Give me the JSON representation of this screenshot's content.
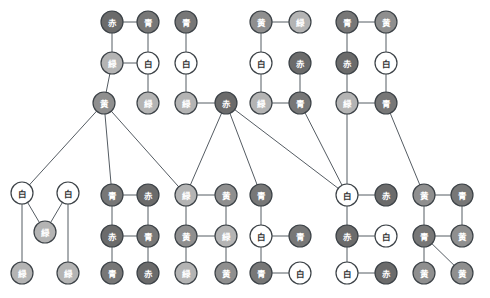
{
  "canvas": {
    "width": 490,
    "height": 298,
    "background": "#ffffff"
  },
  "style": {
    "node_radius": 11,
    "node_stroke": "#3c4247",
    "edge_stroke": "#555c63",
    "edge_width": 1,
    "label_light": "#ffffff",
    "label_dark": "#333333"
  },
  "palette": {
    "赤": "#6b6b6b",
    "青": "#777777",
    "緑": "#b4b4b4",
    "黄": "#8f8f8f",
    "白": "#ffffff"
  },
  "legend": {
    "colors": [
      {
        "name": "赤",
        "label": "赤",
        "hex": "#6b6b6b"
      },
      {
        "name": "青",
        "label": "青",
        "hex": "#777777"
      },
      {
        "name": "緑",
        "label": "緑",
        "hex": "#b4b4b4"
      },
      {
        "name": "黄",
        "label": "黄",
        "hex": "#8f8f8f"
      },
      {
        "name": "白",
        "label": "白",
        "hex": "#ffffff"
      }
    ]
  },
  "graph": {
    "type": "node-link-diagram",
    "node_count": 63,
    "edge_count": 70,
    "nodes": [
      {
        "id": "n1",
        "label": "赤",
        "color": "赤",
        "x": 112,
        "y": 22
      },
      {
        "id": "n2",
        "label": "青",
        "color": "青",
        "x": 148,
        "y": 22
      },
      {
        "id": "n3",
        "label": "青",
        "color": "青",
        "x": 186,
        "y": 22
      },
      {
        "id": "n4",
        "label": "黄",
        "color": "黄",
        "x": 261,
        "y": 22
      },
      {
        "id": "n5",
        "label": "緑",
        "color": "緑",
        "x": 300,
        "y": 22
      },
      {
        "id": "n6",
        "label": "青",
        "color": "青",
        "x": 347,
        "y": 22
      },
      {
        "id": "n7",
        "label": "黄",
        "color": "黄",
        "x": 386,
        "y": 22
      },
      {
        "id": "n8",
        "label": "緑",
        "color": "緑",
        "x": 112,
        "y": 63
      },
      {
        "id": "n9",
        "label": "白",
        "color": "白",
        "x": 148,
        "y": 63
      },
      {
        "id": "n10",
        "label": "白",
        "color": "白",
        "x": 186,
        "y": 63
      },
      {
        "id": "n11",
        "label": "白",
        "color": "白",
        "x": 261,
        "y": 63
      },
      {
        "id": "n12",
        "label": "赤",
        "color": "赤",
        "x": 300,
        "y": 63
      },
      {
        "id": "n13",
        "label": "赤",
        "color": "赤",
        "x": 347,
        "y": 63
      },
      {
        "id": "n14",
        "label": "白",
        "color": "白",
        "x": 386,
        "y": 63
      },
      {
        "id": "n15",
        "label": "黄",
        "color": "黄",
        "x": 104,
        "y": 103
      },
      {
        "id": "n16",
        "label": "緑",
        "color": "緑",
        "x": 148,
        "y": 103
      },
      {
        "id": "n17",
        "label": "緑",
        "color": "緑",
        "x": 186,
        "y": 103
      },
      {
        "id": "n18",
        "label": "赤",
        "color": "赤",
        "x": 226,
        "y": 103
      },
      {
        "id": "n19",
        "label": "緑",
        "color": "緑",
        "x": 261,
        "y": 103
      },
      {
        "id": "n20",
        "label": "青",
        "color": "青",
        "x": 300,
        "y": 103
      },
      {
        "id": "n21",
        "label": "緑",
        "color": "緑",
        "x": 347,
        "y": 103
      },
      {
        "id": "n22",
        "label": "青",
        "color": "青",
        "x": 386,
        "y": 103
      },
      {
        "id": "n23",
        "label": "白",
        "color": "白",
        "x": 22,
        "y": 193
      },
      {
        "id": "n24",
        "label": "白",
        "color": "白",
        "x": 68,
        "y": 193
      },
      {
        "id": "n25",
        "label": "青",
        "color": "青",
        "x": 112,
        "y": 195
      },
      {
        "id": "n26",
        "label": "赤",
        "color": "赤",
        "x": 148,
        "y": 195
      },
      {
        "id": "n27",
        "label": "緑",
        "color": "緑",
        "x": 186,
        "y": 195
      },
      {
        "id": "n28",
        "label": "黄",
        "color": "黄",
        "x": 226,
        "y": 195
      },
      {
        "id": "n29",
        "label": "青",
        "color": "青",
        "x": 261,
        "y": 195
      },
      {
        "id": "n30",
        "label": "白",
        "color": "白",
        "x": 347,
        "y": 195
      },
      {
        "id": "n31",
        "label": "赤",
        "color": "赤",
        "x": 386,
        "y": 195
      },
      {
        "id": "n32",
        "label": "黄",
        "color": "黄",
        "x": 424,
        "y": 195
      },
      {
        "id": "n33",
        "label": "青",
        "color": "青",
        "x": 462,
        "y": 195
      },
      {
        "id": "n34",
        "label": "緑",
        "color": "緑",
        "x": 45,
        "y": 232
      },
      {
        "id": "n35",
        "label": "赤",
        "color": "赤",
        "x": 112,
        "y": 236
      },
      {
        "id": "n36",
        "label": "青",
        "color": "青",
        "x": 148,
        "y": 236
      },
      {
        "id": "n37",
        "label": "黄",
        "color": "黄",
        "x": 186,
        "y": 236
      },
      {
        "id": "n38",
        "label": "緑",
        "color": "緑",
        "x": 226,
        "y": 236
      },
      {
        "id": "n39",
        "label": "白",
        "color": "白",
        "x": 261,
        "y": 236
      },
      {
        "id": "n40",
        "label": "青",
        "color": "青",
        "x": 300,
        "y": 236
      },
      {
        "id": "n41",
        "label": "赤",
        "color": "赤",
        "x": 347,
        "y": 236
      },
      {
        "id": "n42",
        "label": "白",
        "color": "白",
        "x": 386,
        "y": 236
      },
      {
        "id": "n43",
        "label": "青",
        "color": "青",
        "x": 424,
        "y": 236
      },
      {
        "id": "n44",
        "label": "黄",
        "color": "黄",
        "x": 462,
        "y": 236
      },
      {
        "id": "n45",
        "label": "緑",
        "color": "緑",
        "x": 22,
        "y": 273
      },
      {
        "id": "n46",
        "label": "緑",
        "color": "緑",
        "x": 68,
        "y": 273
      },
      {
        "id": "n47",
        "label": "青",
        "color": "青",
        "x": 112,
        "y": 273
      },
      {
        "id": "n48",
        "label": "赤",
        "color": "赤",
        "x": 148,
        "y": 273
      },
      {
        "id": "n49",
        "label": "緑",
        "color": "緑",
        "x": 186,
        "y": 273
      },
      {
        "id": "n50",
        "label": "黄",
        "color": "黄",
        "x": 226,
        "y": 273
      },
      {
        "id": "n51",
        "label": "青",
        "color": "青",
        "x": 261,
        "y": 273
      },
      {
        "id": "n52",
        "label": "白",
        "color": "白",
        "x": 300,
        "y": 273
      },
      {
        "id": "n53",
        "label": "白",
        "color": "白",
        "x": 347,
        "y": 273
      },
      {
        "id": "n54",
        "label": "赤",
        "color": "赤",
        "x": 386,
        "y": 273
      },
      {
        "id": "n55",
        "label": "黄",
        "color": "黄",
        "x": 424,
        "y": 273
      },
      {
        "id": "n56",
        "label": "黄",
        "color": "黄",
        "x": 462,
        "y": 273
      }
    ],
    "edges": [
      [
        "n1",
        "n2"
      ],
      [
        "n1",
        "n8"
      ],
      [
        "n2",
        "n9"
      ],
      [
        "n8",
        "n9"
      ],
      [
        "n8",
        "n15"
      ],
      [
        "n9",
        "n16"
      ],
      [
        "n3",
        "n10"
      ],
      [
        "n10",
        "n17"
      ],
      [
        "n4",
        "n5"
      ],
      [
        "n4",
        "n11"
      ],
      [
        "n11",
        "n19"
      ],
      [
        "n12",
        "n20"
      ],
      [
        "n19",
        "n20"
      ],
      [
        "n6",
        "n7"
      ],
      [
        "n6",
        "n13"
      ],
      [
        "n7",
        "n14"
      ],
      [
        "n13",
        "n21"
      ],
      [
        "n14",
        "n22"
      ],
      [
        "n21",
        "n22"
      ],
      [
        "n17",
        "n18"
      ],
      [
        "n15",
        "n23"
      ],
      [
        "n15",
        "n25"
      ],
      [
        "n15",
        "n27"
      ],
      [
        "n18",
        "n27"
      ],
      [
        "n18",
        "n29"
      ],
      [
        "n18",
        "n30"
      ],
      [
        "n20",
        "n30"
      ],
      [
        "n21",
        "n30"
      ],
      [
        "n22",
        "n32"
      ],
      [
        "n23",
        "n34"
      ],
      [
        "n24",
        "n34"
      ],
      [
        "n23",
        "n45"
      ],
      [
        "n24",
        "n46"
      ],
      [
        "n25",
        "n26"
      ],
      [
        "n25",
        "n35"
      ],
      [
        "n26",
        "n36"
      ],
      [
        "n35",
        "n36"
      ],
      [
        "n35",
        "n47"
      ],
      [
        "n36",
        "n48"
      ],
      [
        "n27",
        "n28"
      ],
      [
        "n27",
        "n37"
      ],
      [
        "n28",
        "n38"
      ],
      [
        "n37",
        "n38"
      ],
      [
        "n37",
        "n49"
      ],
      [
        "n38",
        "n50"
      ],
      [
        "n29",
        "n39"
      ],
      [
        "n39",
        "n40"
      ],
      [
        "n39",
        "n51"
      ],
      [
        "n51",
        "n52"
      ],
      [
        "n30",
        "n31"
      ],
      [
        "n30",
        "n41"
      ],
      [
        "n41",
        "n42"
      ],
      [
        "n41",
        "n53"
      ],
      [
        "n53",
        "n54"
      ],
      [
        "n32",
        "n33"
      ],
      [
        "n32",
        "n43"
      ],
      [
        "n33",
        "n44"
      ],
      [
        "n43",
        "n44"
      ],
      [
        "n43",
        "n55"
      ],
      [
        "n43",
        "n56"
      ]
    ]
  }
}
